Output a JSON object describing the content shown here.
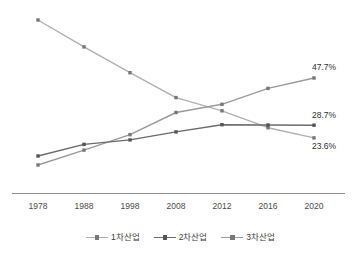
{
  "chart_data": {
    "type": "line",
    "title": "",
    "subtitle": "",
    "xlabel": "",
    "ylabel": "",
    "categories": [
      "1978",
      "1988",
      "1998",
      "2008",
      "2012",
      "2016",
      "2020"
    ],
    "x": [
      1978,
      1988,
      1998,
      2008,
      2012,
      2016,
      2020
    ],
    "ylim": [
      0,
      75
    ],
    "grid": false,
    "legend_position": "bottom",
    "axis": {
      "x_visible": true,
      "y_visible": false
    },
    "series": [
      {
        "name": "1차산업",
        "color": "#b0b0b0",
        "values": [
          71.0,
          60.2,
          49.8,
          39.8,
          34.5,
          27.7,
          23.6
        ],
        "end_label": "23.6%"
      },
      {
        "name": "2차산업",
        "color": "#6b6b6b",
        "values": [
          16.3,
          21.0,
          22.8,
          26.0,
          28.9,
          28.8,
          28.7
        ],
        "end_label": "28.7%"
      },
      {
        "name": "3차산업",
        "color": "#9a9a9a",
        "values": [
          12.7,
          18.7,
          24.9,
          33.8,
          37.1,
          43.5,
          47.7
        ],
        "end_label": "47.7%"
      }
    ],
    "value_labels": [
      {
        "text": "47.7%",
        "series": "3차산업",
        "at": "2020"
      },
      {
        "text": "28.7%",
        "series": "2차산업",
        "at": "2020"
      },
      {
        "text": "23.6%",
        "series": "1차산업",
        "at": "2020"
      }
    ],
    "tick_labels": [
      "1978",
      "1988",
      "1998",
      "2008",
      "2012",
      "2016",
      "2020"
    ],
    "legend_entries": [
      "1차산업",
      "2차산업",
      "3차산업"
    ]
  },
  "colors": {
    "series_1": "#b0b0b0",
    "series_2": "#6b6b6b",
    "series_3": "#9a9a9a",
    "axis": "#8d8d8d",
    "text": "#3b3b3b",
    "background": "#ffffff"
  }
}
